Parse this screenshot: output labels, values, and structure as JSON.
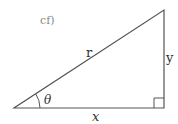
{
  "caption": "cf)",
  "diagram": {
    "type": "right-triangle",
    "labels": {
      "hypotenuse": "r",
      "opposite": "y",
      "adjacent": "x",
      "angle": "θ"
    },
    "vertices": {
      "angle_vertex": [
        14,
        108
      ],
      "right_angle_vertex": [
        164,
        108
      ],
      "top_vertex": [
        164,
        10
      ]
    },
    "line_color": "#555555"
  }
}
